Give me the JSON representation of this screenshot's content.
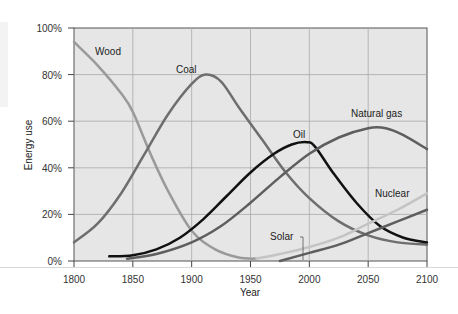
{
  "chart_data": {
    "type": "line",
    "title": "",
    "xlabel": "Year",
    "ylabel": "Energy use",
    "xlim": [
      1800,
      2100
    ],
    "ylim": [
      0,
      100
    ],
    "x_ticks": [
      "1800",
      "1850",
      "1900",
      "1950",
      "2000",
      "2050",
      "2100"
    ],
    "y_ticks": [
      "0%",
      "20%",
      "40%",
      "60%",
      "80%",
      "100%"
    ],
    "grid": true,
    "legend": "inline labels",
    "series": [
      {
        "name": "Wood",
        "color": "#9a9a9a",
        "width": 2.5,
        "points": [
          [
            1800,
            94
          ],
          [
            1820,
            84
          ],
          [
            1840,
            72
          ],
          [
            1850,
            64
          ],
          [
            1865,
            46
          ],
          [
            1880,
            30
          ],
          [
            1900,
            13
          ],
          [
            1920,
            5
          ],
          [
            1940,
            1.5
          ],
          [
            1955,
            1
          ]
        ]
      },
      {
        "name": "Coal",
        "color": "#6e6e6e",
        "width": 2.5,
        "points": [
          [
            1800,
            8
          ],
          [
            1820,
            16
          ],
          [
            1840,
            29
          ],
          [
            1860,
            46
          ],
          [
            1880,
            63
          ],
          [
            1900,
            76
          ],
          [
            1912,
            80
          ],
          [
            1925,
            77
          ],
          [
            1940,
            66
          ],
          [
            1960,
            52
          ],
          [
            1980,
            38
          ],
          [
            2000,
            27
          ],
          [
            2025,
            17
          ],
          [
            2050,
            11
          ],
          [
            2075,
            8
          ],
          [
            2100,
            7
          ]
        ]
      },
      {
        "name": "Oil",
        "color": "#111111",
        "width": 2.5,
        "points": [
          [
            1830,
            2
          ],
          [
            1850,
            2.5
          ],
          [
            1870,
            5
          ],
          [
            1890,
            10
          ],
          [
            1910,
            18
          ],
          [
            1930,
            28
          ],
          [
            1950,
            38
          ],
          [
            1970,
            46
          ],
          [
            1985,
            50
          ],
          [
            1998,
            51
          ],
          [
            2005,
            49
          ],
          [
            2020,
            38
          ],
          [
            2040,
            25
          ],
          [
            2060,
            15
          ],
          [
            2080,
            10
          ],
          [
            2100,
            8
          ]
        ]
      },
      {
        "name": "Natural gas",
        "color": "#5e5e5e",
        "width": 2.5,
        "points": [
          [
            1845,
            1
          ],
          [
            1870,
            3
          ],
          [
            1900,
            8
          ],
          [
            1925,
            15
          ],
          [
            1950,
            25
          ],
          [
            1975,
            36
          ],
          [
            2000,
            46
          ],
          [
            2025,
            53
          ],
          [
            2050,
            57
          ],
          [
            2065,
            57
          ],
          [
            2080,
            54
          ],
          [
            2100,
            48
          ]
        ]
      },
      {
        "name": "Nuclear",
        "color": "#c4c4c4",
        "width": 2.5,
        "points": [
          [
            1955,
            1
          ],
          [
            1975,
            3
          ],
          [
            2000,
            6
          ],
          [
            2025,
            10
          ],
          [
            2050,
            16
          ],
          [
            2075,
            22
          ],
          [
            2100,
            29
          ]
        ]
      },
      {
        "name": "Solar",
        "color": "#5e5e5e",
        "width": 2.5,
        "points": [
          [
            1975,
            0
          ],
          [
            2000,
            3.5
          ],
          [
            2025,
            7
          ],
          [
            2050,
            12
          ],
          [
            2075,
            17
          ],
          [
            2100,
            22
          ]
        ]
      }
    ],
    "annotations": [
      {
        "text": "Wood",
        "x": 1810,
        "y": 91
      },
      {
        "text": "Coal",
        "x": 1893,
        "y": 82
      },
      {
        "text": "Oil",
        "x": 1990,
        "y": 54
      },
      {
        "text": "Natural gas",
        "x": 2040,
        "y": 66
      },
      {
        "text": "Nuclear",
        "x": 2068,
        "y": 28
      },
      {
        "text": "Solar",
        "x": 1958,
        "y": 7,
        "leader_to": [
          1993,
          0.5
        ]
      }
    ]
  },
  "labels": {
    "xlabel": "Year",
    "ylabel": "Energy use",
    "wood": "Wood",
    "coal": "Coal",
    "oil": "Oil",
    "natural_gas": "Natural gas",
    "nuclear": "Nuclear",
    "solar": "Solar"
  }
}
